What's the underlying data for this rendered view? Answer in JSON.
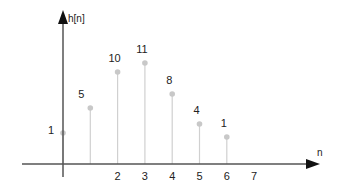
{
  "chart_data": {
    "type": "stem",
    "title": "",
    "xlabel": "n",
    "ylabel": "h[n]",
    "x": [
      0,
      1,
      2,
      3,
      4,
      5,
      6
    ],
    "values": [
      1,
      5,
      10,
      11,
      8,
      4,
      1
    ],
    "value_labels": [
      "1",
      "5",
      "10",
      "11",
      "8",
      "4",
      "1"
    ],
    "x_tick_labels": [
      "2",
      "3",
      "4",
      "5",
      "6",
      "7"
    ],
    "x_tick_positions": [
      2,
      3,
      4,
      5,
      6,
      7
    ],
    "grid": false,
    "legend": null
  },
  "colors": {
    "axis": "#555555",
    "stem": "#d0d0d0",
    "marker": "#c8c8c8",
    "text": "#222222"
  },
  "layout": {
    "origin_x": 63,
    "baseline_y": 164,
    "unit_x": 27.3,
    "points_y": [
      133,
      108,
      72,
      63,
      94,
      124,
      137
    ]
  }
}
